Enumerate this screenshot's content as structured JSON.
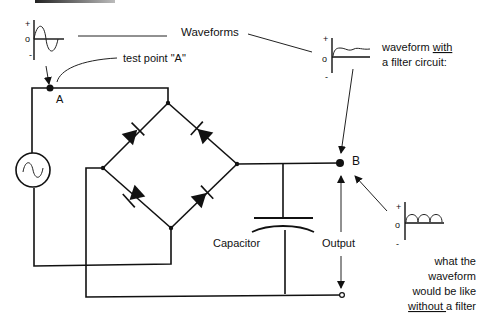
{
  "diagram": {
    "title_label": "Waveforms",
    "test_point_label": "test point \"A\"",
    "node_a_label": "A",
    "node_b_label": "B",
    "capacitor_label": "Capacitor",
    "output_label": "Output",
    "filtered_caption_line1_prefix": "waveform ",
    "filtered_caption_line1_emph": "with",
    "filtered_caption_line2": "a filter circuit:",
    "unfiltered_caption_line1": "what the",
    "unfiltered_caption_line2": "waveform",
    "unfiltered_caption_line3": "would be like",
    "unfiltered_caption_line4_emph": "without ",
    "unfiltered_caption_line4_suffix": "a filter",
    "axis_plus": "+",
    "axis_zero": "o",
    "axis_minus": "-",
    "waveforms": [
      {
        "name": "ac-input-sine",
        "description": "sine wave at test point A"
      },
      {
        "name": "filtered-dc",
        "description": "nearly flat DC with small ripple"
      },
      {
        "name": "full-wave-rectified",
        "description": "series of positive half-sine humps"
      }
    ],
    "components": [
      "ac-source",
      "diode-bridge-4",
      "capacitor",
      "output-terminals"
    ],
    "colors": {
      "ink": "#111111",
      "background": "#ffffff"
    }
  }
}
